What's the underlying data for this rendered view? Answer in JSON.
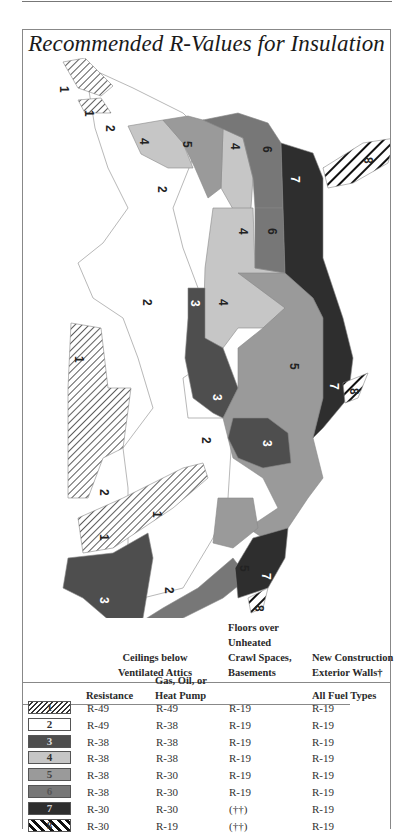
{
  "title": "Recommended R-Values for Insulation",
  "colors": {
    "zone1": "hatch-thin",
    "zone2": "#ffffff",
    "zone3": "#4e4e4e",
    "zone4": "#c6c6c6",
    "zone5": "#9a9a9a",
    "zone6": "#777777",
    "zone7": "#2e2e2e",
    "zone8": "hatch-bold"
  },
  "map": {
    "labels": [
      {
        "zone": "1",
        "x": 60,
        "y": 23
      },
      {
        "zone": "1",
        "x": 63,
        "y": 52
      },
      {
        "zone": "2",
        "x": 87,
        "y": 70
      },
      {
        "zone": "4",
        "x": 120,
        "y": 83
      },
      {
        "zone": "5",
        "x": 163,
        "y": 86
      },
      {
        "zone": "4",
        "x": 213,
        "y": 87
      },
      {
        "zone": "6",
        "x": 243,
        "y": 90
      },
      {
        "zone": "8",
        "x": 352,
        "y": 102
      },
      {
        "zone": "7",
        "x": 270,
        "y": 121
      },
      {
        "zone": "2",
        "x": 138,
        "y": 130
      },
      {
        "zone": "4",
        "x": 219,
        "y": 172
      },
      {
        "zone": "6",
        "x": 248,
        "y": 172
      },
      {
        "zone": "2",
        "x": 123,
        "y": 244
      },
      {
        "zone": "3",
        "x": 170,
        "y": 245
      },
      {
        "zone": "4",
        "x": 198,
        "y": 244
      },
      {
        "zone": "1",
        "x": 55,
        "y": 300
      },
      {
        "zone": "5",
        "x": 270,
        "y": 308
      },
      {
        "zone": "7",
        "x": 310,
        "y": 328
      },
      {
        "zone": "8",
        "x": 330,
        "y": 333
      },
      {
        "zone": "3",
        "x": 193,
        "y": 339
      },
      {
        "zone": "2",
        "x": 182,
        "y": 382
      },
      {
        "zone": "3",
        "x": 243,
        "y": 385
      },
      {
        "zone": "2",
        "x": 80,
        "y": 434
      },
      {
        "zone": "1",
        "x": 133,
        "y": 456
      },
      {
        "zone": "1",
        "x": 80,
        "y": 479
      },
      {
        "zone": "2",
        "x": 145,
        "y": 532
      },
      {
        "zone": "3",
        "x": 80,
        "y": 542
      },
      {
        "zone": "5",
        "x": 220,
        "y": 510
      },
      {
        "zone": "7",
        "x": 242,
        "y": 518
      },
      {
        "zone": "8",
        "x": 235,
        "y": 550
      },
      {
        "zone": "4",
        "x": 92,
        "y": 592
      },
      {
        "zone": "6",
        "x": 122,
        "y": 592
      }
    ]
  },
  "table": {
    "group_headers": {
      "ceilings": [
        "Ceilings below",
        "Ventilated Attics"
      ],
      "floors": [
        "Floors over",
        "Unheated",
        "Crawl Spaces,",
        "Basements"
      ],
      "walls": [
        "New Construction",
        "Exterior Walls†"
      ]
    },
    "sub_headers": {
      "resistance": "Resistance",
      "gas_oil_heatpump": [
        "Gas, Oil, or",
        "Heat Pump"
      ],
      "all_fuel": "All Fuel Types"
    },
    "rows": [
      {
        "zone": "1",
        "resistance": "R-49",
        "gas_oil": "R-49",
        "floors": "R-19",
        "walls": "R-19"
      },
      {
        "zone": "2",
        "resistance": "R-49",
        "gas_oil": "R-38",
        "floors": "R-19",
        "walls": "R-19"
      },
      {
        "zone": "3",
        "resistance": "R-38",
        "gas_oil": "R-38",
        "floors": "R-19",
        "walls": "R-19"
      },
      {
        "zone": "4",
        "resistance": "R-38",
        "gas_oil": "R-38",
        "floors": "R-19",
        "walls": "R-19"
      },
      {
        "zone": "5",
        "resistance": "R-38",
        "gas_oil": "R-30",
        "floors": "R-19",
        "walls": "R-19"
      },
      {
        "zone": "6",
        "resistance": "R-38",
        "gas_oil": "R-30",
        "floors": "R-19",
        "walls": "R-19"
      },
      {
        "zone": "7",
        "resistance": "R-30",
        "gas_oil": "R-30",
        "floors": "(††)",
        "walls": "R-19"
      },
      {
        "zone": "8",
        "resistance": "R-30",
        "gas_oil": "R-19",
        "floors": "(††)",
        "walls": "R-19"
      }
    ]
  }
}
